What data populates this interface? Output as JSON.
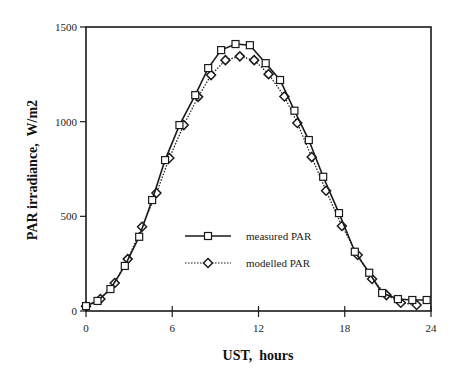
{
  "chart_data": {
    "type": "line",
    "title": "",
    "xlabel": "UST,  hours",
    "ylabel": "PAR irradiance,  W/m2",
    "xlim": [
      0,
      24
    ],
    "ylim": [
      0,
      1500
    ],
    "xticks": [
      0,
      6,
      12,
      18,
      24
    ],
    "yticks": [
      0,
      500,
      1000,
      1500
    ],
    "grid": false,
    "legend_position": "center-right inside plot",
    "series": [
      {
        "name": "measured PAR",
        "marker": "square",
        "line_style": "solid",
        "x": [
          0,
          0.8,
          1.7,
          2.7,
          3.7,
          4.6,
          5.5,
          6.5,
          7.6,
          8.5,
          9.4,
          10.4,
          11.4,
          12.5,
          13.5,
          14.5,
          15.5,
          16.5,
          17.6,
          18.7,
          19.7,
          20.6,
          21.7,
          22.7,
          23.7
        ],
        "values": [
          26,
          53,
          116,
          238,
          392,
          586,
          797,
          982,
          1140,
          1283,
          1378,
          1410,
          1404,
          1309,
          1220,
          1058,
          903,
          709,
          517,
          313,
          202,
          95,
          63,
          58,
          58
        ]
      },
      {
        "name": "modelled PAR",
        "marker": "diamond",
        "line_style": "dotted",
        "x": [
          0,
          1,
          2,
          2.9,
          3.9,
          4.9,
          5.8,
          6.8,
          7.8,
          8.7,
          9.7,
          10.7,
          11.7,
          12.7,
          13.8,
          14.7,
          15.7,
          16.7,
          17.8,
          18.9,
          19.9,
          20.9,
          21.9,
          23
        ],
        "values": [
          25,
          63,
          148,
          274,
          445,
          623,
          808,
          982,
          1131,
          1246,
          1325,
          1345,
          1325,
          1251,
          1133,
          993,
          813,
          635,
          449,
          296,
          169,
          84,
          44,
          32
        ]
      }
    ]
  },
  "axes": {
    "x_title": "UST,  hours",
    "y_title": "PAR irradiance,  W/m2",
    "x_tick_labels": [
      "0",
      "6",
      "12",
      "18",
      "24"
    ],
    "y_tick_labels": [
      "0",
      "500",
      "1000",
      "1500"
    ]
  },
  "legend": {
    "items": [
      {
        "label": "measured PAR"
      },
      {
        "label": "modelled PAR"
      }
    ]
  },
  "colors": {
    "line": "#1a1a1a",
    "marker_fill": "#ffffff",
    "background": "#ffffff"
  }
}
